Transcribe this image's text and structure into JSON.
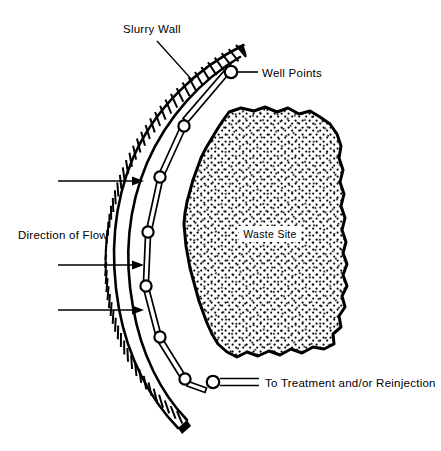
{
  "figure": {
    "type": "engineering-cross-section-diagram",
    "background_color": "#ffffff",
    "ink_color": "#000000",
    "width": 441,
    "height": 451
  },
  "labels": {
    "slurry_wall": "Slurry Wall",
    "well_points": "Well Points",
    "direction_of_flow": "Direction of Flow",
    "waste_site": "Waste Site",
    "to_treatment": "To Treatment and/or Reinjection"
  },
  "elements": {
    "slurry_wall": {
      "name": "Slurry Wall",
      "rendering": "hatched curved band",
      "hatch_count": 58,
      "band_thickness_px": 13,
      "top_end": "tapered point",
      "bottom_end": "blunt cut"
    },
    "well_point_line": {
      "name": "Well Points",
      "rendering": "chain of circular nodes joined by tapered double-line segments",
      "node_count": 8
    },
    "waste_site": {
      "name": "Waste Site",
      "rendering": "irregular closed blob, thick outline, dense stipple fill",
      "fill_pattern": "stipple-dots"
    },
    "discharge_pipe": {
      "name": "To Treatment and/or Reinjection",
      "rendering": "horizontal double-line pipe"
    },
    "flow_arrows": {
      "name": "Direction of Flow",
      "count": 3,
      "direction": "left-to-right",
      "arrow_y": [
        181,
        265,
        310
      ]
    }
  },
  "leaders": {
    "slurry_wall_leader": "diagonal line from label to wall band",
    "well_points_leader": "horizontal line from top node to label",
    "discharge_leader": "double horizontal line from lowest node to label"
  }
}
